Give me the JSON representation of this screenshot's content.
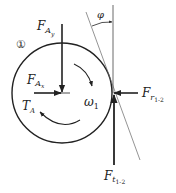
{
  "diagram": {
    "type": "free-body diagram",
    "body_marker": "①",
    "angle_label": "φ",
    "labels": {
      "FAy": {
        "main": "F",
        "sub": "A",
        "subsub": "y"
      },
      "FAx": {
        "main": "F",
        "sub": "A",
        "subsub": "x"
      },
      "TA": {
        "main": "T",
        "sub": "A"
      },
      "omega": {
        "main": "ω",
        "sub": "1"
      },
      "Fr": {
        "main": "F",
        "sub": "r",
        "subsub": "1-2"
      },
      "Ft": {
        "main": "F",
        "sub": "t",
        "subsub": "1-2"
      }
    },
    "colors": {
      "stroke": "#222222",
      "thin": "#555555",
      "background": "#ffffff"
    }
  }
}
